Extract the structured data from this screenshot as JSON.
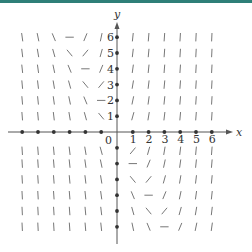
{
  "diagram": {
    "type": "slope_field",
    "colors": {
      "axis": "#555555",
      "segment": "#777777",
      "dot": "#333333",
      "topbar": "#2f7f78"
    },
    "axes": {
      "x_label": "x",
      "y_label": "y",
      "origin_label": "0"
    },
    "x_ticks": [
      "1",
      "2",
      "3",
      "4",
      "5",
      "6"
    ],
    "y_ticks": [
      "1",
      "2",
      "3",
      "4",
      "5",
      "6"
    ],
    "range": {
      "x": [
        -6,
        6
      ],
      "y": [
        -6,
        6
      ]
    },
    "slope_rule": "zero slope along y = -2x (slope proportional to 2x + y)"
  }
}
